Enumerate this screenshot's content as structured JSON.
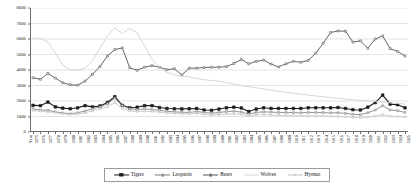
{
  "chart_data": {
    "type": "line",
    "title": "",
    "xlabel": "Year",
    "ylabel": "",
    "ylim": [
      0,
      8000
    ],
    "yticks": [
      0,
      1000,
      2000,
      3000,
      4000,
      5000,
      6000,
      7000,
      8000
    ],
    "ytick_labels": [
      "0",
      "1000",
      "2000",
      "3000",
      "4000",
      "5000",
      "6000",
      "7000",
      "8000"
    ],
    "grid": true,
    "grid_axis": "y",
    "legend_position": "bottom",
    "x_axis_first_label": "Year",
    "categories": [
      "1875",
      "1876",
      "1877",
      "1878",
      "1879",
      "1880",
      "1881",
      "1882",
      "1883",
      "1884",
      "1885",
      "1886",
      "1887",
      "1888",
      "1889",
      "1890",
      "1891",
      "1892",
      "1893",
      "1894",
      "1895",
      "1896",
      "1897",
      "1898",
      "1899",
      "1900",
      "1901",
      "1902",
      "1903",
      "1904",
      "1905",
      "1906",
      "1907",
      "1908",
      "1909",
      "1910",
      "1911",
      "1912",
      "1913",
      "1914",
      "1915",
      "1916",
      "1917",
      "1918",
      "1919",
      "1920",
      "1921",
      "1922",
      "1923",
      "1924",
      "1925"
    ],
    "series": [
      {
        "name": "Tigers",
        "color": "#1c1c1c",
        "marker": "square-filled",
        "marker_size": 2.6,
        "line_width": 1.1,
        "values": [
          1720,
          1700,
          1930,
          1620,
          1540,
          1500,
          1560,
          1700,
          1620,
          1680,
          1900,
          2280,
          1720,
          1560,
          1600,
          1700,
          1700,
          1580,
          1520,
          1500,
          1490,
          1500,
          1520,
          1420,
          1400,
          1480,
          1560,
          1600,
          1550,
          1320,
          1480,
          1560,
          1520,
          1520,
          1520,
          1520,
          1520,
          1560,
          1560,
          1560,
          1560,
          1580,
          1520,
          1440,
          1420,
          1600,
          1900,
          2380,
          1800,
          1760,
          1560
        ]
      },
      {
        "name": "Leopards",
        "color": "#7a7a7a",
        "marker": "square-small",
        "marker_size": 1.8,
        "line_width": 0.8,
        "values": [
          1500,
          1420,
          1400,
          1300,
          1220,
          1180,
          1240,
          1360,
          1500,
          1620,
          1820,
          2180,
          1700,
          1500,
          1440,
          1500,
          1450,
          1400,
          1330,
          1300,
          1280,
          1260,
          1320,
          1260,
          1220,
          1260,
          1320,
          1340,
          1280,
          1160,
          1260,
          1300,
          1280,
          1260,
          1260,
          1250,
          1240,
          1260,
          1260,
          1250,
          1240,
          1240,
          1200,
          1140,
          1120,
          1240,
          1420,
          1700,
          1420,
          1380,
          1260
        ]
      },
      {
        "name": "Bears",
        "color": "#555555",
        "marker": "square-small",
        "marker_size": 1.9,
        "line_width": 0.9,
        "values": [
          3500,
          3400,
          3780,
          3480,
          3180,
          3050,
          3020,
          3280,
          3720,
          4220,
          4900,
          5320,
          5420,
          4150,
          3980,
          4180,
          4280,
          4180,
          4020,
          4080,
          3680,
          4120,
          4120,
          4160,
          4180,
          4180,
          4220,
          4420,
          4680,
          4400,
          4560,
          4640,
          4380,
          4200,
          4400,
          4560,
          4500,
          4620,
          5080,
          5720,
          6420,
          6520,
          6500,
          5800,
          5880,
          5400,
          6000,
          6200,
          5380,
          5200,
          4900
        ]
      },
      {
        "name": "Wolves",
        "color": "#d6d6d6",
        "marker": "none",
        "marker_size": 0,
        "line_width": 1.0,
        "values": [
          6050,
          6050,
          5800,
          5100,
          4300,
          4000,
          3980,
          4120,
          4600,
          5400,
          6200,
          6720,
          6350,
          6680,
          6400,
          5550,
          4700,
          4150,
          3850,
          3700,
          3600,
          3560,
          3450,
          3380,
          3320,
          3280,
          3180,
          3100,
          3000,
          2920,
          2850,
          2780,
          2700,
          2620,
          2560,
          2500,
          2450,
          2380,
          2320,
          2280,
          2220,
          2180,
          2120,
          2080,
          2040,
          2000,
          1960,
          1920,
          1880,
          1840,
          1800
        ]
      },
      {
        "name": "Hyenas",
        "color": "#c0c0c0",
        "marker": "square-small",
        "marker_size": 1.6,
        "line_width": 0.8,
        "values": [
          1380,
          1340,
          1300,
          1240,
          1180,
          1140,
          1160,
          1240,
          1360,
          1480,
          1620,
          1900,
          1520,
          1360,
          1320,
          1340,
          1320,
          1280,
          1220,
          1200,
          1180,
          1160,
          1200,
          1140,
          1100,
          1120,
          1160,
          1180,
          1140,
          1040,
          1100,
          1120,
          1100,
          1080,
          1060,
          1050,
          1040,
          1040,
          1030,
          1020,
          1010,
          1000,
          980,
          940,
          920,
          960,
          1020,
          1120,
          1020,
          1000,
          960
        ]
      }
    ]
  }
}
